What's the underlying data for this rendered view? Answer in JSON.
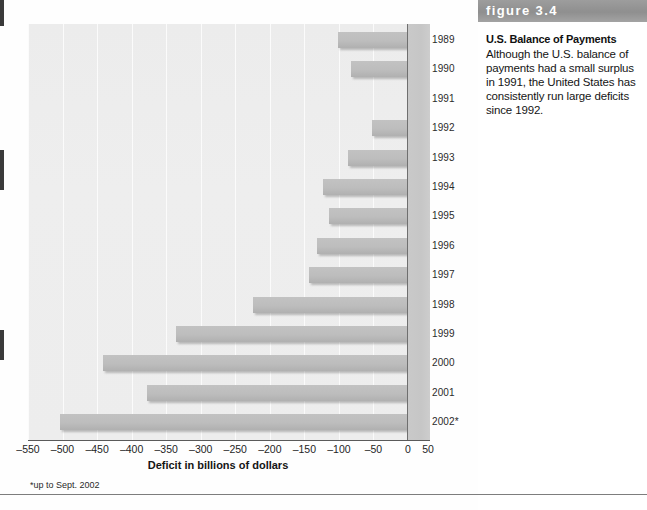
{
  "figure": {
    "band_label": "figure 3.4",
    "title": "U.S. Balance of Payments",
    "body": "Although the U.S. balance of payments had a small surplus in 1991, the United States has consistently run large deficits since 1992."
  },
  "footnote": "*up to Sept. 2002",
  "colors": {
    "bar": "#bdbdbd",
    "plot_background": "#ededed",
    "year_panel": "#c9c9c9",
    "band": "#9d9d9d",
    "axis": "#5a5a5a",
    "gridline": "#fbfbfb"
  },
  "chart_data": {
    "type": "bar",
    "orientation": "horizontal",
    "title": "U.S. Balance of Payments",
    "xlabel": "Deficit in billions of dollars",
    "ylabel": "",
    "xlim": [
      -550,
      50
    ],
    "xticks": [
      -550,
      -500,
      -450,
      -400,
      -350,
      -300,
      -250,
      -200,
      -150,
      -100,
      -50,
      0,
      50
    ],
    "xtick_labels": [
      "–550",
      "–500",
      "–450",
      "–400",
      "–350",
      "–300",
      "–250",
      "–200",
      "–150",
      "–100",
      "–50",
      "0",
      "50"
    ],
    "grid": true,
    "legend": false,
    "categories": [
      "1989",
      "1990",
      "1991",
      "1992",
      "1993",
      "1994",
      "1995",
      "1996",
      "1997",
      "1998",
      "1999",
      "2000",
      "2001",
      "2002*"
    ],
    "values": [
      -101,
      -82,
      4,
      -52,
      -87,
      -123,
      -114,
      -132,
      -143,
      -224,
      -336,
      -442,
      -378,
      -504
    ],
    "bars": [
      {
        "year": "1989",
        "value": -101
      },
      {
        "year": "1990",
        "value": -82
      },
      {
        "year": "1991",
        "value": 4
      },
      {
        "year": "1992",
        "value": -52
      },
      {
        "year": "1993",
        "value": -87
      },
      {
        "year": "1994",
        "value": -123
      },
      {
        "year": "1995",
        "value": -114
      },
      {
        "year": "1996",
        "value": -132
      },
      {
        "year": "1997",
        "value": -143
      },
      {
        "year": "1998",
        "value": -224
      },
      {
        "year": "1999",
        "value": -336
      },
      {
        "year": "2000",
        "value": -442
      },
      {
        "year": "2001",
        "value": -378
      },
      {
        "year": "2002*",
        "value": -504
      }
    ]
  }
}
